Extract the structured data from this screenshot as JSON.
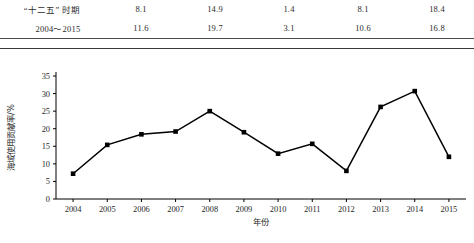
{
  "table": {
    "rows": [
      {
        "label": "“十二五” 时期",
        "values": [
          "8.1",
          "14.9",
          "1.4",
          "8.1",
          "18.4"
        ]
      },
      {
        "label": "2004～2015",
        "values": [
          "11.6",
          "19.7",
          "3.1",
          "10.6",
          "16.8"
        ]
      }
    ]
  },
  "chart_data": {
    "type": "line",
    "title": "",
    "xlabel": "年份",
    "ylabel": "海域使用贡献率/%",
    "categories": [
      "2004",
      "2005",
      "2006",
      "2007",
      "2008",
      "2009",
      "2010",
      "2011",
      "2012",
      "2013",
      "2014",
      "2015"
    ],
    "values": [
      7.2,
      15.4,
      18.4,
      19.2,
      25.0,
      19.0,
      12.9,
      15.7,
      8.0,
      26.2,
      30.7,
      12.0
    ],
    "series": [
      {
        "name": "海域使用贡献率",
        "values": [
          7.2,
          15.4,
          18.4,
          19.2,
          25.0,
          19.0,
          12.9,
          15.7,
          8.0,
          26.2,
          30.7,
          12.0
        ]
      }
    ],
    "yticks": [
      0,
      5,
      10,
      15,
      20,
      25,
      30,
      35
    ],
    "ylim": [
      0,
      35
    ],
    "grid": false,
    "legend": "none",
    "marker": "square",
    "line_color": "#000000",
    "marker_color": "#000000"
  }
}
